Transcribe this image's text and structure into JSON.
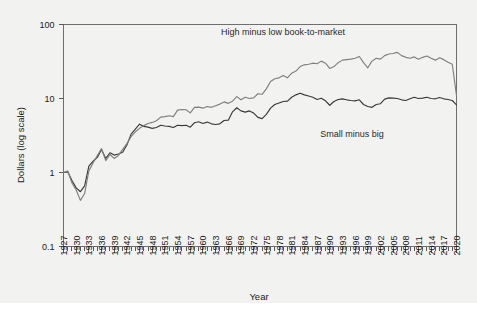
{
  "figure": {
    "background_color": "#f2f2f0",
    "frame_color": "#6e6e6e"
  },
  "axis_titles": {
    "x": "Year",
    "y": "Dollars (log scale)"
  },
  "annotations": [
    {
      "name": "hml-label",
      "text": "High minus low book-to-market",
      "x": 283,
      "y": 35
    },
    {
      "name": "smb-label",
      "text": "Small minus big",
      "x": 352,
      "y": 137
    }
  ],
  "chart_data": {
    "type": "line",
    "title": "",
    "subtitle": "",
    "xlabel": "Year",
    "ylabel": "Dollars (log scale)",
    "yscale": "log",
    "ylim": [
      0.1,
      100
    ],
    "ytick_values": [
      100,
      10,
      1,
      0.1
    ],
    "ytick_labels": [
      "100",
      "10",
      "1",
      "0.1"
    ],
    "xlim": [
      1927,
      2020
    ],
    "xtick_step": 1,
    "xlabel_step": 3,
    "xtick_labels": [
      "1927",
      "1930",
      "1933",
      "1936",
      "1939",
      "1942",
      "1945",
      "1948",
      "1951",
      "1954",
      "1957",
      "1960",
      "1963",
      "1966",
      "1969",
      "1972",
      "1975",
      "1978",
      "1981",
      "1984",
      "1987",
      "1990",
      "1993",
      "1996",
      "1999",
      "2002",
      "2005",
      "2008",
      "2011",
      "2014",
      "2017",
      "2020"
    ],
    "grid": false,
    "legend_position": "inline-annotations",
    "x": [
      1927,
      1928,
      1929,
      1930,
      1931,
      1932,
      1933,
      1934,
      1935,
      1936,
      1937,
      1938,
      1939,
      1940,
      1941,
      1942,
      1943,
      1944,
      1945,
      1946,
      1947,
      1948,
      1949,
      1950,
      1951,
      1952,
      1953,
      1954,
      1955,
      1956,
      1957,
      1958,
      1959,
      1960,
      1961,
      1962,
      1963,
      1964,
      1965,
      1966,
      1967,
      1968,
      1969,
      1970,
      1971,
      1972,
      1973,
      1974,
      1975,
      1976,
      1977,
      1978,
      1979,
      1980,
      1981,
      1982,
      1983,
      1984,
      1985,
      1986,
      1987,
      1988,
      1989,
      1990,
      1991,
      1992,
      1993,
      1994,
      1995,
      1996,
      1997,
      1998,
      1999,
      2000,
      2001,
      2002,
      2003,
      2004,
      2005,
      2006,
      2007,
      2008,
      2009,
      2010,
      2011,
      2012,
      2013,
      2014,
      2015,
      2016,
      2017,
      2018,
      2019,
      2020
    ],
    "series": [
      {
        "name": "Small minus big",
        "color": "#3a3a3a",
        "values": [
          1.0,
          1.02,
          0.78,
          0.62,
          0.55,
          0.66,
          1.22,
          1.42,
          1.6,
          2.05,
          1.55,
          1.85,
          1.72,
          1.78,
          1.88,
          2.35,
          3.3,
          3.85,
          4.5,
          4.2,
          4.1,
          3.95,
          4.05,
          4.35,
          4.25,
          4.2,
          4.05,
          4.35,
          4.3,
          4.35,
          4.1,
          4.7,
          4.85,
          4.6,
          4.8,
          4.55,
          4.45,
          4.55,
          5.05,
          5.1,
          6.6,
          7.5,
          6.8,
          6.55,
          6.8,
          6.35,
          5.55,
          5.35,
          6.1,
          7.4,
          8.3,
          8.7,
          9.1,
          9.2,
          10.4,
          11.2,
          11.8,
          11.2,
          10.8,
          10.4,
          9.7,
          10.1,
          9.3,
          8.1,
          9.1,
          9.7,
          9.9,
          9.6,
          9.4,
          9.3,
          9.6,
          8.3,
          7.8,
          7.6,
          8.3,
          8.5,
          9.8,
          10.2,
          10.1,
          10.0,
          9.6,
          9.4,
          9.9,
          10.4,
          10.0,
          10.1,
          10.4,
          10.0,
          9.9,
          10.3,
          9.9,
          9.7,
          9.4,
          8.2
        ],
        "label_text": "Small minus big"
      },
      {
        "name": "High minus low book-to-market",
        "color": "#7f7f7f",
        "values": [
          1.0,
          1.05,
          0.72,
          0.58,
          0.42,
          0.52,
          1.05,
          1.35,
          1.7,
          2.1,
          1.45,
          1.75,
          1.55,
          1.7,
          2.05,
          2.45,
          3.05,
          3.55,
          3.95,
          4.3,
          4.6,
          4.75,
          5.0,
          5.6,
          5.7,
          5.85,
          5.7,
          6.95,
          7.1,
          7.05,
          6.4,
          7.6,
          7.65,
          7.4,
          7.8,
          7.6,
          8.0,
          8.4,
          9.0,
          8.6,
          9.2,
          10.6,
          9.6,
          10.4,
          10.0,
          10.2,
          11.6,
          11.4,
          13.5,
          17.0,
          18.5,
          19.0,
          20.5,
          19.0,
          22.0,
          23.5,
          27.0,
          28.5,
          29.0,
          30.0,
          29.5,
          32.0,
          30.0,
          25.5,
          27.0,
          30.5,
          33.0,
          33.5,
          34.0,
          35.0,
          37.0,
          30.5,
          26.0,
          32.0,
          35.0,
          34.0,
          38.0,
          40.0,
          40.5,
          42.0,
          38.0,
          36.0,
          35.0,
          36.5,
          34.0,
          36.0,
          37.5,
          35.0,
          33.0,
          35.5,
          33.5,
          31.0,
          29.0,
          11.0
        ],
        "label_text": "High minus low book-to-market"
      }
    ]
  }
}
